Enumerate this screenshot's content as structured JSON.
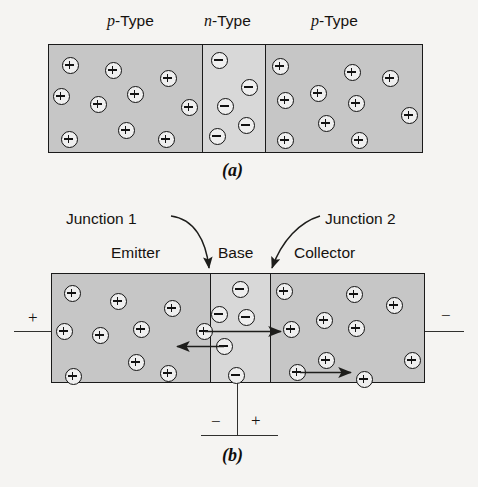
{
  "figure": {
    "title_present": false,
    "type": "semiconductor-pnp-transistor-diagram",
    "background_color": "#f5f4f2",
    "p_region_color": "#c6c6c6",
    "n_region_color": "#d8d8d8",
    "outline_color": "#1a1a1a"
  },
  "panel_a": {
    "caption": "(a)",
    "region_labels": [
      {
        "italic_prefix": "p",
        "suffix": "-Type"
      },
      {
        "italic_prefix": "n",
        "suffix": "-Type"
      },
      {
        "italic_prefix": "p",
        "suffix": "-Type"
      }
    ],
    "regions": [
      {
        "name": "p-Type",
        "doping": "p",
        "carrier_symbol": "+",
        "carrier_count": 9
      },
      {
        "name": "n-Type",
        "doping": "n",
        "carrier_symbol": "−",
        "carrier_count": 6
      },
      {
        "name": "p-Type",
        "doping": "p",
        "carrier_symbol": "+",
        "carrier_count": 10
      }
    ],
    "carriers_left": [
      {
        "x": 62,
        "y": 57
      },
      {
        "x": 105,
        "y": 62
      },
      {
        "x": 160,
        "y": 70
      },
      {
        "x": 53,
        "y": 88
      },
      {
        "x": 90,
        "y": 96
      },
      {
        "x": 127,
        "y": 86
      },
      {
        "x": 181,
        "y": 99
      },
      {
        "x": 118,
        "y": 122
      },
      {
        "x": 61,
        "y": 131
      },
      {
        "x": 158,
        "y": 131
      }
    ],
    "carriers_middle": [
      {
        "x": 211,
        "y": 52
      },
      {
        "x": 241,
        "y": 79
      },
      {
        "x": 217,
        "y": 98
      },
      {
        "x": 238,
        "y": 117
      },
      {
        "x": 209,
        "y": 128
      }
    ],
    "carriers_right": [
      {
        "x": 272,
        "y": 58
      },
      {
        "x": 344,
        "y": 64
      },
      {
        "x": 382,
        "y": 70
      },
      {
        "x": 277,
        "y": 92
      },
      {
        "x": 310,
        "y": 85
      },
      {
        "x": 348,
        "y": 95
      },
      {
        "x": 401,
        "y": 107
      },
      {
        "x": 318,
        "y": 115
      },
      {
        "x": 277,
        "y": 132
      },
      {
        "x": 351,
        "y": 132
      }
    ]
  },
  "panel_b": {
    "caption": "(b)",
    "annotations": [
      {
        "name": "junction-1",
        "label": "Junction 1"
      },
      {
        "name": "junction-2",
        "label": "Junction 2"
      }
    ],
    "region_labels": [
      {
        "label": "Emitter"
      },
      {
        "label": "Base"
      },
      {
        "label": "Collector"
      }
    ],
    "regions": [
      {
        "name": "Emitter",
        "doping": "p",
        "carrier_symbol": "+"
      },
      {
        "name": "Base",
        "doping": "n",
        "carrier_symbol": "−"
      },
      {
        "name": "Collector",
        "doping": "p",
        "carrier_symbol": "+"
      }
    ],
    "terminals": [
      {
        "name": "emitter-terminal",
        "sign": "+"
      },
      {
        "name": "collector-terminal",
        "sign": "−"
      }
    ],
    "battery": {
      "negative_sign": "−",
      "positive_sign": "+"
    },
    "current_arrows": [
      {
        "name": "hole-injection-arrow",
        "direction": "right"
      },
      {
        "name": "electron-base-current-arrow",
        "direction": "left"
      },
      {
        "name": "hole-collector-arrow",
        "direction": "right"
      }
    ],
    "carriers_emitter": [
      {
        "x": 64,
        "y": 285
      },
      {
        "x": 110,
        "y": 293
      },
      {
        "x": 164,
        "y": 300
      },
      {
        "x": 56,
        "y": 323
      },
      {
        "x": 92,
        "y": 327
      },
      {
        "x": 133,
        "y": 321
      },
      {
        "x": 196,
        "y": 323
      },
      {
        "x": 128,
        "y": 354
      },
      {
        "x": 65,
        "y": 368
      },
      {
        "x": 160,
        "y": 365
      }
    ],
    "carriers_base": [
      {
        "x": 232,
        "y": 281
      },
      {
        "x": 213,
        "y": 306
      },
      {
        "x": 238,
        "y": 309
      },
      {
        "x": 216,
        "y": 338
      },
      {
        "x": 228,
        "y": 367
      }
    ],
    "carriers_collector": [
      {
        "x": 276,
        "y": 283
      },
      {
        "x": 346,
        "y": 286
      },
      {
        "x": 386,
        "y": 297
      },
      {
        "x": 283,
        "y": 321
      },
      {
        "x": 316,
        "y": 312
      },
      {
        "x": 348,
        "y": 320
      },
      {
        "x": 404,
        "y": 352
      },
      {
        "x": 318,
        "y": 352
      },
      {
        "x": 289,
        "y": 364
      },
      {
        "x": 356,
        "y": 371
      }
    ]
  }
}
